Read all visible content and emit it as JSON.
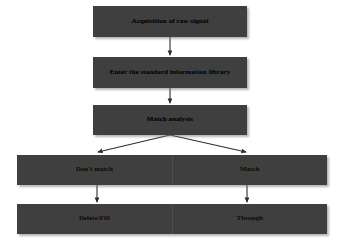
{
  "diagram": {
    "theme": {
      "node_fill": "#3f3f3f",
      "text_color": "#0a0a0a",
      "background": "#ffffff",
      "connector_color": "#333333",
      "shadow_color": "#9a9a9a"
    },
    "nodes": [
      {
        "id": "acquisition",
        "label": "Acquisition of raw signal",
        "x": 93,
        "y": 6,
        "w": 154,
        "h": 31
      },
      {
        "id": "standard-library",
        "label": "Enter the standard information library",
        "x": 93,
        "y": 57,
        "w": 154,
        "h": 31
      },
      {
        "id": "match-analysis",
        "label": "Match analysis",
        "x": 93,
        "y": 105,
        "w": 154,
        "h": 30
      }
    ],
    "branch_rows": [
      {
        "id": "match-decision-row",
        "x": 17,
        "y": 155,
        "w": 310,
        "h": 30,
        "left_label": "Don't match",
        "right_label": "Match"
      },
      {
        "id": "outcome-row",
        "x": 17,
        "y": 204,
        "w": 310,
        "h": 30,
        "left_label": "Delete/Fill",
        "right_label": "Through"
      }
    ],
    "connectors": [
      {
        "id": "acquisition-to-library",
        "type": "vertical-arrow",
        "x": 170,
        "y1": 37,
        "y2": 55
      },
      {
        "id": "library-to-match-analysis",
        "type": "vertical-arrow",
        "x": 170,
        "y1": 88,
        "y2": 103
      },
      {
        "id": "match-analysis-to-dont-match",
        "type": "diagonal-arrow",
        "x1": 170,
        "y1": 135,
        "x2": 97,
        "y2": 153
      },
      {
        "id": "match-analysis-to-match",
        "type": "diagonal-arrow",
        "x1": 170,
        "y1": 135,
        "x2": 247,
        "y2": 153
      },
      {
        "id": "dont-match-to-delete-fill",
        "type": "vertical-arrow",
        "x": 97,
        "y1": 185,
        "y2": 202
      },
      {
        "id": "match-to-through",
        "type": "vertical-arrow",
        "x": 247,
        "y1": 185,
        "y2": 202
      }
    ]
  }
}
